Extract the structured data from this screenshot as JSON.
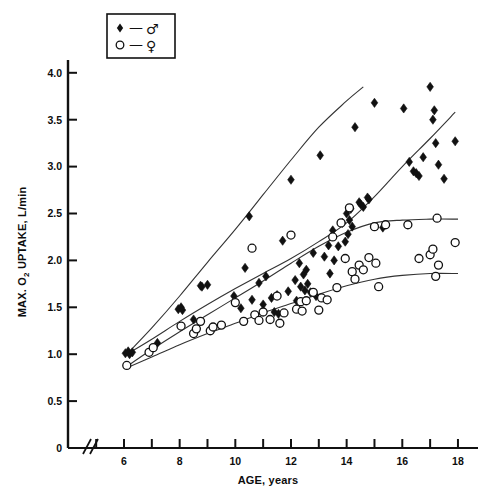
{
  "figure": {
    "background_color": "#ffffff",
    "ink_color": "#111111"
  },
  "legend": {
    "name": "legend-box",
    "entries": [
      {
        "marker": "filled-diamond",
        "dash": "—",
        "symbol": "♂",
        "label": "male"
      },
      {
        "marker": "open-circle",
        "dash": "—",
        "symbol": "♀",
        "label": "female"
      }
    ]
  },
  "chart_data": {
    "type": "scatter",
    "title": "",
    "xlabel": "AGE, years",
    "ylabel": "MAX. O2 UPTAKE, L/min",
    "ylabel_main": "MAX. O",
    "ylabel_sub": "2",
    "ylabel_tail": " UPTAKE, L/min",
    "xlim": [
      5,
      18.6
    ],
    "ylim": [
      0,
      4.25
    ],
    "grid": false,
    "legend_position": "top-left",
    "axis_break": true,
    "axis_break_symbol": "//",
    "xticks": [
      5,
      6,
      7,
      8,
      9,
      10,
      11,
      12,
      13,
      14,
      15,
      16,
      17,
      18
    ],
    "xtick_labels": [
      "",
      "6",
      "",
      "8",
      "",
      "10",
      "",
      "12",
      "",
      "14",
      "",
      "16",
      "",
      "18"
    ],
    "yticks": [
      0,
      0.5,
      1.0,
      1.5,
      2.0,
      2.5,
      3.0,
      3.5,
      4.0
    ],
    "ytick_labels": [
      "0",
      "0.5",
      "1.0",
      "1.5",
      "2.0",
      "2.5",
      "3.0",
      "3.5",
      "4.0"
    ],
    "series": [
      {
        "name": "male",
        "marker": "filled-diamond",
        "color": "#111111",
        "points": [
          [
            6.05,
            1.01
          ],
          [
            6.2,
            1.0
          ],
          [
            6.15,
            1.03
          ],
          [
            6.3,
            1.02
          ],
          [
            7.2,
            1.12
          ],
          [
            7.95,
            1.48
          ],
          [
            8.05,
            1.5
          ],
          [
            8.1,
            1.47
          ],
          [
            8.5,
            1.37
          ],
          [
            8.75,
            1.73
          ],
          [
            8.8,
            1.72
          ],
          [
            9.0,
            1.74
          ],
          [
            9.95,
            1.62
          ],
          [
            10.2,
            1.49
          ],
          [
            10.35,
            1.92
          ],
          [
            10.5,
            2.47
          ],
          [
            10.6,
            1.58
          ],
          [
            10.85,
            1.76
          ],
          [
            11.0,
            1.53
          ],
          [
            11.1,
            1.83
          ],
          [
            11.3,
            1.6
          ],
          [
            11.4,
            1.45
          ],
          [
            11.5,
            1.63
          ],
          [
            11.55,
            1.43
          ],
          [
            11.7,
            2.21
          ],
          [
            11.9,
            1.67
          ],
          [
            12.0,
            2.86
          ],
          [
            12.15,
            1.79
          ],
          [
            12.2,
            1.57
          ],
          [
            12.3,
            1.97
          ],
          [
            12.35,
            1.72
          ],
          [
            12.45,
            1.85
          ],
          [
            12.5,
            1.68
          ],
          [
            12.55,
            1.9
          ],
          [
            12.6,
            1.75
          ],
          [
            12.7,
            1.66
          ],
          [
            12.8,
            2.08
          ],
          [
            12.9,
            1.62
          ],
          [
            13.05,
            3.12
          ],
          [
            13.2,
            2.04
          ],
          [
            13.35,
            2.16
          ],
          [
            13.4,
            1.86
          ],
          [
            13.5,
            2.32
          ],
          [
            13.55,
            2.0
          ],
          [
            13.7,
            2.15
          ],
          [
            13.85,
            2.4
          ],
          [
            13.95,
            2.2
          ],
          [
            14.0,
            2.5
          ],
          [
            14.05,
            2.28
          ],
          [
            14.1,
            2.43
          ],
          [
            14.15,
            2.55
          ],
          [
            14.2,
            2.36
          ],
          [
            14.3,
            3.42
          ],
          [
            14.45,
            2.62
          ],
          [
            14.5,
            2.6
          ],
          [
            14.6,
            2.57
          ],
          [
            14.75,
            2.67
          ],
          [
            14.8,
            2.65
          ],
          [
            15.0,
            3.68
          ],
          [
            15.3,
            2.35
          ],
          [
            16.05,
            3.62
          ],
          [
            16.25,
            3.05
          ],
          [
            16.4,
            2.95
          ],
          [
            16.5,
            2.93
          ],
          [
            16.6,
            2.9
          ],
          [
            16.75,
            3.1
          ],
          [
            17.0,
            3.85
          ],
          [
            17.1,
            3.5
          ],
          [
            17.15,
            3.6
          ],
          [
            17.2,
            3.25
          ],
          [
            17.3,
            3.02
          ],
          [
            17.5,
            2.87
          ],
          [
            17.9,
            3.27
          ]
        ]
      },
      {
        "name": "female",
        "marker": "open-circle",
        "color": "#111111",
        "points": [
          [
            6.1,
            0.88
          ],
          [
            6.9,
            1.02
          ],
          [
            7.05,
            1.07
          ],
          [
            8.05,
            1.3
          ],
          [
            8.5,
            1.22
          ],
          [
            8.6,
            1.27
          ],
          [
            8.75,
            1.35
          ],
          [
            9.1,
            1.25
          ],
          [
            9.2,
            1.29
          ],
          [
            9.5,
            1.31
          ],
          [
            10.0,
            1.55
          ],
          [
            10.3,
            1.35
          ],
          [
            10.6,
            2.13
          ],
          [
            10.7,
            1.42
          ],
          [
            10.85,
            1.36
          ],
          [
            11.0,
            1.45
          ],
          [
            11.25,
            1.37
          ],
          [
            11.5,
            1.62
          ],
          [
            11.6,
            1.33
          ],
          [
            11.75,
            1.44
          ],
          [
            12.0,
            2.27
          ],
          [
            12.2,
            1.48
          ],
          [
            12.35,
            1.56
          ],
          [
            12.4,
            1.46
          ],
          [
            12.55,
            1.57
          ],
          [
            12.8,
            1.66
          ],
          [
            13.0,
            1.47
          ],
          [
            13.1,
            1.6
          ],
          [
            13.3,
            1.58
          ],
          [
            13.5,
            2.25
          ],
          [
            13.65,
            1.71
          ],
          [
            13.8,
            2.4
          ],
          [
            13.95,
            2.02
          ],
          [
            14.1,
            2.56
          ],
          [
            14.2,
            1.88
          ],
          [
            14.3,
            1.8
          ],
          [
            14.45,
            1.95
          ],
          [
            14.6,
            1.9
          ],
          [
            14.8,
            2.03
          ],
          [
            15.0,
            2.36
          ],
          [
            15.05,
            1.97
          ],
          [
            15.15,
            1.72
          ],
          [
            15.4,
            2.38
          ],
          [
            16.2,
            2.38
          ],
          [
            16.6,
            2.02
          ],
          [
            17.0,
            2.06
          ],
          [
            17.1,
            2.12
          ],
          [
            17.2,
            1.83
          ],
          [
            17.25,
            2.45
          ],
          [
            17.3,
            1.95
          ],
          [
            17.9,
            2.19
          ]
        ]
      }
    ],
    "curves": [
      {
        "name": "male-upper-envelope",
        "points": [
          [
            6.1,
            1.0
          ],
          [
            7.0,
            1.28
          ],
          [
            8.0,
            1.62
          ],
          [
            9.0,
            1.98
          ],
          [
            10.0,
            2.33
          ],
          [
            11.0,
            2.7
          ],
          [
            12.0,
            3.07
          ],
          [
            13.0,
            3.42
          ],
          [
            14.0,
            3.7
          ],
          [
            14.6,
            3.85
          ]
        ]
      },
      {
        "name": "male-lower-envelope",
        "points": [
          [
            6.1,
            1.0
          ],
          [
            7.0,
            1.16
          ],
          [
            8.0,
            1.35
          ],
          [
            9.0,
            1.53
          ],
          [
            10.0,
            1.7
          ],
          [
            11.0,
            1.86
          ],
          [
            12.0,
            2.02
          ],
          [
            13.0,
            2.2
          ],
          [
            14.0,
            2.4
          ],
          [
            15.0,
            2.68
          ],
          [
            16.0,
            3.0
          ],
          [
            17.0,
            3.3
          ],
          [
            17.9,
            3.58
          ]
        ]
      },
      {
        "name": "female-upper-envelope",
        "points": [
          [
            6.15,
            0.88
          ],
          [
            7.0,
            1.05
          ],
          [
            8.0,
            1.24
          ],
          [
            9.0,
            1.42
          ],
          [
            10.0,
            1.6
          ],
          [
            11.0,
            1.78
          ],
          [
            12.0,
            1.97
          ],
          [
            13.0,
            2.15
          ],
          [
            14.0,
            2.3
          ],
          [
            15.0,
            2.4
          ],
          [
            16.0,
            2.43
          ],
          [
            17.0,
            2.44
          ],
          [
            18.0,
            2.44
          ]
        ]
      },
      {
        "name": "female-lower-envelope",
        "points": [
          [
            6.15,
            0.86
          ],
          [
            7.0,
            0.97
          ],
          [
            8.0,
            1.1
          ],
          [
            9.0,
            1.22
          ],
          [
            10.0,
            1.33
          ],
          [
            11.0,
            1.44
          ],
          [
            12.0,
            1.54
          ],
          [
            13.0,
            1.64
          ],
          [
            14.0,
            1.73
          ],
          [
            15.0,
            1.8
          ],
          [
            16.0,
            1.84
          ],
          [
            17.0,
            1.86
          ],
          [
            18.0,
            1.86
          ]
        ]
      }
    ]
  }
}
